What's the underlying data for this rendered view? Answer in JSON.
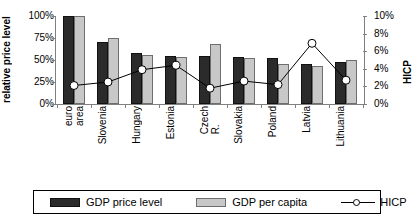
{
  "chart_data": {
    "type": "bar",
    "title": "",
    "subtitle": "",
    "categories": [
      "euro\narea",
      "Slovenia",
      "Hungary",
      "Estonia",
      "Czech\nR.",
      "Slovakia",
      "Poland",
      "Latvia",
      "Lithuania"
    ],
    "series": [
      {
        "name": "GDP price level",
        "axis": "left",
        "values": [
          100,
          71,
          58,
          55,
          54,
          53,
          52,
          45,
          48
        ]
      },
      {
        "name": "GDP per capita",
        "axis": "left",
        "values": [
          100,
          75,
          56,
          53,
          68,
          52,
          46,
          43,
          50
        ]
      },
      {
        "name": "HICP",
        "axis": "right",
        "values": [
          2.1,
          2.5,
          3.9,
          4.4,
          1.8,
          2.6,
          2.2,
          6.9,
          2.7
        ]
      }
    ],
    "ylabel": "relative price level",
    "y2label": "HICP",
    "xlabel": "",
    "ylim": [
      0,
      100
    ],
    "y2lim": [
      0,
      10
    ],
    "yticks": [
      "0%",
      "25%",
      "50%",
      "75%",
      "100%"
    ],
    "y2ticks": [
      "0%",
      "2%",
      "4%",
      "6%",
      "8%",
      "10%"
    ],
    "grid": false,
    "legend_position": "bottom",
    "colors": {
      "gdp_price_level": "#2b2b2b",
      "gdp_per_capita": "#c8c8c8",
      "hicp_marker_fill": "#ffffff",
      "hicp_line": "#000000",
      "axis": "#808080"
    }
  },
  "axes": {
    "left_title": "relative price level",
    "right_title": "HICP"
  },
  "legend": {
    "items": [
      {
        "label": "GDP price level",
        "kind": "bar-dark"
      },
      {
        "label": "GDP per capita",
        "kind": "bar-light"
      },
      {
        "label": "HICP",
        "kind": "line-marker"
      }
    ]
  }
}
